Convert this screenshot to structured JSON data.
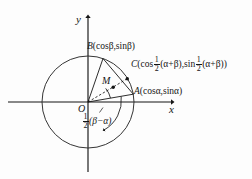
{
  "figure": {
    "axes": {
      "x_label": "x",
      "y_label": "y",
      "origin_label": "O"
    },
    "points": [
      {
        "id": "A",
        "label": "A(cosα,sinα)",
        "name_text": "A",
        "coords_text": "(cosα,sinα)"
      },
      {
        "id": "B",
        "label": "B(cosβ,sinβ)",
        "name_text": "B",
        "coords_text": "(cosβ,sinβ)"
      },
      {
        "id": "C",
        "name_text": "C",
        "open_paren": "(cos",
        "frac_num": "1",
        "frac_den": "2",
        "arg_one": "(α+β),sin",
        "arg_two": "(α+β)",
        "close_paren": ")"
      },
      {
        "id": "M",
        "label": "M",
        "name_text": "M"
      }
    ],
    "angle_label": {
      "frac_num": "1",
      "frac_den": "2",
      "expr": "(β−α)"
    },
    "colors": {
      "stroke": "#151515",
      "circle": "#2a2a2a",
      "background": "#fdfdfd",
      "text": "#151515"
    },
    "geometry": {
      "center_x": 88,
      "center_y": 102,
      "radius": 46,
      "point_A": [
        133,
        95
      ],
      "point_B": [
        103,
        59
      ],
      "point_C": [
        126,
        71
      ],
      "point_M": [
        113,
        79
      ]
    }
  }
}
